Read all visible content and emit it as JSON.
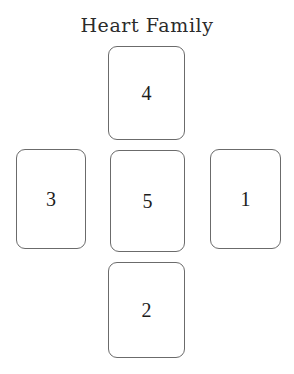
{
  "page": {
    "title": "Heart Family",
    "background_color": "#ffffff"
  },
  "spread": {
    "name": "Heart Family",
    "layout": "cross",
    "card_border_color": "#6b6b6b",
    "card_fill_color": "#ffffff",
    "number_color": "#1c1c1c",
    "positions": [
      {
        "label": "4",
        "slot": "top"
      },
      {
        "label": "3",
        "slot": "left"
      },
      {
        "label": "5",
        "slot": "center"
      },
      {
        "label": "1",
        "slot": "right"
      },
      {
        "label": "2",
        "slot": "bottom"
      }
    ]
  }
}
